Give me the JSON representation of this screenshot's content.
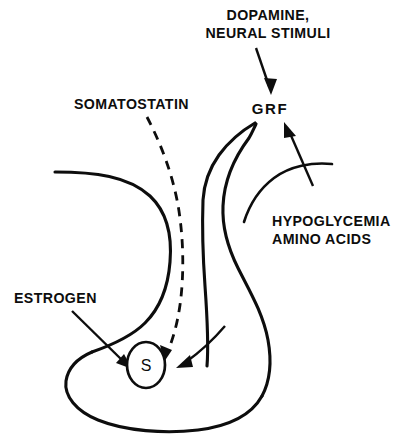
{
  "figure": {
    "type": "physiological-regulation-diagram",
    "background_color": "#ffffff",
    "line_color": "#0d0d0d"
  },
  "labels": {
    "dopamine_line1": "DOPAMINE,",
    "dopamine_line2": "NEURAL STIMULI",
    "somatostatin": "SOMATOSTATIN",
    "grf": "GRF",
    "hypoglycemia_line1": "HYPOGLYCEMIA",
    "hypoglycemia_line2": "AMINO ACIDS",
    "estrogen": "ESTROGEN",
    "cell_marker": "S"
  },
  "connections": [
    {
      "id": "dopamine-to-grf",
      "from": "DOPAMINE, NEURAL STIMULI",
      "to": "GRF",
      "style": "solid-arrow",
      "direction": "down-right"
    },
    {
      "id": "hypoglycemia-to-grf",
      "from": "HYPOGLYCEMIA AMINO ACIDS",
      "to": "GRF",
      "style": "solid-arrow",
      "direction": "up-left"
    },
    {
      "id": "somatostatin-to-cell",
      "from": "SOMATOSTATIN",
      "to": "S",
      "style": "dashed-arrow",
      "direction": "down"
    },
    {
      "id": "estrogen-to-cell",
      "from": "ESTROGEN",
      "to": "S",
      "style": "solid-arrow",
      "direction": "down-right"
    },
    {
      "id": "stalk-to-cell",
      "from": "GRF",
      "to": "S",
      "style": "solid-arrow",
      "direction": "down-left"
    }
  ]
}
